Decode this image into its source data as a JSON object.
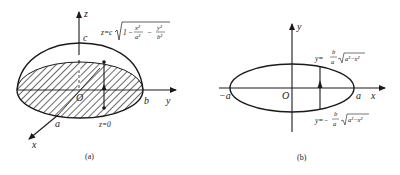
{
  "figure_a": {
    "caption": "(a)",
    "axis_labels": {
      "z": "z",
      "y": "y",
      "x": "x"
    },
    "point_labels": {
      "c": "c",
      "b": "b",
      "a": "a",
      "origin": "O"
    },
    "surface_equation": {
      "lhs": "z=c",
      "radicand_one": "1",
      "minus": "−",
      "term1_num": "x²",
      "term1_den": "a²",
      "term2_num": "y²",
      "term2_den": "b²"
    },
    "base_plane_label": "z=0"
  },
  "figure_b": {
    "caption": "(b)",
    "axis_labels": {
      "y": "y",
      "x": "x"
    },
    "point_labels": {
      "neg_a": "−a",
      "a": "a",
      "origin": "O"
    },
    "upper_curve": {
      "lhs": "y=",
      "num": "b",
      "den": "a",
      "radical": "a²−x²"
    },
    "lower_curve": {
      "lhs": "y=−",
      "num": "b",
      "den": "a",
      "radical": "a²−x²"
    }
  },
  "colors": {
    "ink": "#1a1a1a",
    "background": "#ffffff"
  }
}
